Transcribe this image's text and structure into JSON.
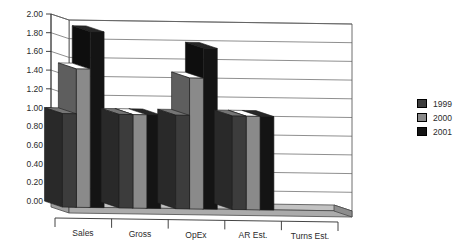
{
  "chart_data": {
    "type": "bar",
    "title": "",
    "subtitle": "",
    "xlabel": "",
    "ylabel": "",
    "categories": [
      "Sales",
      "Gross",
      "OpEx",
      "AR Est.",
      "Turns Est."
    ],
    "series": [
      {
        "name": "1999",
        "color": "#3c3c3c",
        "values": [
          1.0,
          1.0,
          1.0,
          1.0,
          0.0
        ]
      },
      {
        "name": "2000",
        "color": "#8a8a8a",
        "values": [
          1.48,
          1.0,
          1.4,
          1.0,
          0.0
        ]
      },
      {
        "name": "2001",
        "color": "#141414",
        "values": [
          1.88,
          1.0,
          1.72,
          1.0,
          0.0
        ]
      }
    ],
    "ylim": [
      0.0,
      2.0
    ],
    "ytick_step": 0.2,
    "ytick_labels": [
      "0.00",
      "0.20",
      "0.40",
      "0.60",
      "0.80",
      "1.00",
      "1.20",
      "1.40",
      "1.60",
      "1.80",
      "2.00"
    ],
    "grid": true,
    "grid_axis": "y",
    "legend_position": "right",
    "legend_entries": [
      "1999",
      "2000",
      "2001"
    ],
    "three_d": true,
    "plot_background": "#ffffff",
    "axis_color": "#3a3a3a",
    "grid_color": "#5a5a5a",
    "floor_color": "#b9b9b9"
  },
  "legend": {
    "items": [
      {
        "label": "1999",
        "color": "#3c3c3c"
      },
      {
        "label": "2000",
        "color": "#8a8a8a"
      },
      {
        "label": "2001",
        "color": "#141414"
      }
    ]
  }
}
